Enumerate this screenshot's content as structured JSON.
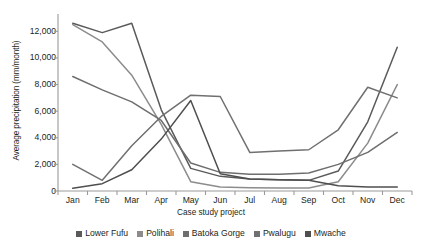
{
  "chart_data": {
    "type": "line",
    "title": "",
    "xlabel": "Case study project",
    "ylabel": "Average precipitation (mm/month)",
    "categories": [
      "Jan",
      "Feb",
      "Mar",
      "Apr",
      "May",
      "Jun",
      "Jul",
      "Aug",
      "Sep",
      "Oct",
      "Nov",
      "Dec"
    ],
    "ylim": [
      0,
      13000
    ],
    "yticks": [
      0,
      2000,
      4000,
      6000,
      8000,
      10000,
      12000
    ],
    "ytick_labels": [
      "0",
      "2,000",
      "4,000",
      "6,000",
      "8,000",
      "10,000",
      "12,000"
    ],
    "grid": false,
    "legend_position": "bottom",
    "series": [
      {
        "name": "Lower Fufu",
        "color": "#5a5a5a",
        "values": [
          12600,
          11900,
          12600,
          6100,
          1700,
          1100,
          900,
          850,
          800,
          1500,
          5200,
          10800
        ]
      },
      {
        "name": "Polihali",
        "color": "#8c8c8c",
        "values": [
          12500,
          11200,
          8700,
          5000,
          700,
          300,
          250,
          230,
          220,
          700,
          3600,
          8000
        ]
      },
      {
        "name": "Batoka Gorge",
        "color": "#6e6e6e",
        "values": [
          8600,
          7600,
          6700,
          5300,
          2100,
          1400,
          1250,
          1250,
          1350,
          2000,
          2900,
          4400
        ]
      },
      {
        "name": "Pwalugu",
        "color": "#707070",
        "values": [
          2000,
          800,
          3400,
          5600,
          7200,
          7100,
          2900,
          3000,
          3100,
          4600,
          7800,
          7000
        ]
      },
      {
        "name": "Mwache",
        "color": "#4f4f4f",
        "values": [
          200,
          550,
          1600,
          3900,
          6800,
          1300,
          900,
          850,
          800,
          400,
          300,
          300
        ]
      }
    ]
  },
  "axes": {
    "x_axis_title": "Case study project",
    "y_axis_title": "Average precipitation (mm/month)"
  },
  "legend": {
    "items": [
      {
        "label": "Lower Fufu",
        "color": "#5a5a5a"
      },
      {
        "label": "Polihali",
        "color": "#8c8c8c"
      },
      {
        "label": "Batoka Gorge",
        "color": "#6e6e6e"
      },
      {
        "label": "Pwalugu",
        "color": "#707070"
      },
      {
        "label": "Mwache",
        "color": "#4f4f4f"
      }
    ]
  }
}
